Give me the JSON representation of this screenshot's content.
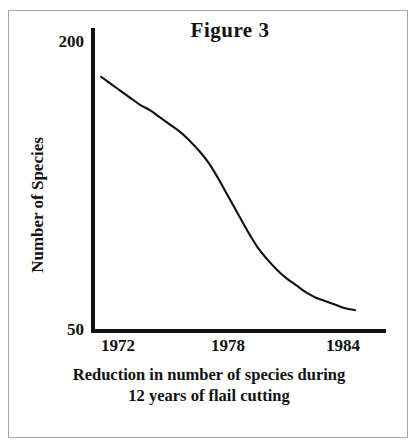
{
  "figure": {
    "title": "Figure 3",
    "caption_line1": "Reduction in number of species during",
    "caption_line2": "12 years of flail cutting",
    "border_color": "#a8a8a8",
    "ink_color": "#111111",
    "background": "#ffffff"
  },
  "chart_data": {
    "type": "line",
    "title": "Figure 3",
    "xlabel": "",
    "ylabel": "Number of Species",
    "xlim": [
      1972,
      1985
    ],
    "ylim": [
      50,
      200
    ],
    "grid": false,
    "legend": false,
    "y_tick_labels": [
      "200",
      "50"
    ],
    "y_ticks": [
      200,
      50
    ],
    "x_tick_labels": [
      "1972",
      "1978",
      "1984"
    ],
    "x_ticks": [
      1972,
      1978,
      1984
    ],
    "series": [
      {
        "name": "Number of Species",
        "color": "#111111",
        "x": [
          1972.0,
          1972.5,
          1973.0,
          1973.5,
          1974.0,
          1974.5,
          1975.0,
          1975.5,
          1976.0,
          1976.5,
          1977.0,
          1977.5,
          1978.0,
          1978.5,
          1979.0,
          1979.5,
          1980.0,
          1980.5,
          1981.0,
          1981.5,
          1982.0,
          1982.5,
          1983.0,
          1983.5,
          1984.0,
          1984.5,
          1985.0
        ],
        "values": [
          195,
          191,
          187,
          183,
          179,
          176,
          172,
          168,
          164,
          159,
          153,
          146,
          137,
          127,
          117,
          107,
          98,
          91,
          85,
          80,
          76,
          72,
          69,
          67,
          65,
          63,
          62
        ]
      }
    ],
    "annotations": [
      "Sigmoid decline in species count over 12 years of flail cutting",
      "Steepest reduction occurs between 1978 and 1980",
      "Curve flattens near 1983-1985"
    ]
  }
}
